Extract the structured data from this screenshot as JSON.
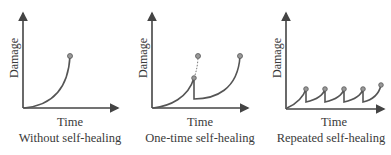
{
  "panels": [
    {
      "id": "without",
      "ylabel": "Damage",
      "xlabel": "Time",
      "caption": "Without self-healing"
    },
    {
      "id": "one-time",
      "ylabel": "Damage",
      "xlabel": "Time",
      "caption": "One-time self-healing"
    },
    {
      "id": "repeated",
      "ylabel": "Damage",
      "xlabel": "Time",
      "caption": "Repeated self-healing"
    }
  ],
  "colors": {
    "axis": "#444444",
    "curve": "#555555",
    "marker": "#888888"
  }
}
